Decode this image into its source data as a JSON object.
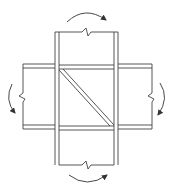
{
  "diagram": {
    "colors": {
      "stroke": "#333333",
      "background": "#ffffff"
    },
    "elements": [
      "column-upper",
      "column-lower",
      "beam-left",
      "beam-right",
      "panel-zone",
      "diagonal-stiffener",
      "moment-arrow-top",
      "moment-arrow-bottom",
      "moment-arrow-left",
      "moment-arrow-right"
    ]
  }
}
